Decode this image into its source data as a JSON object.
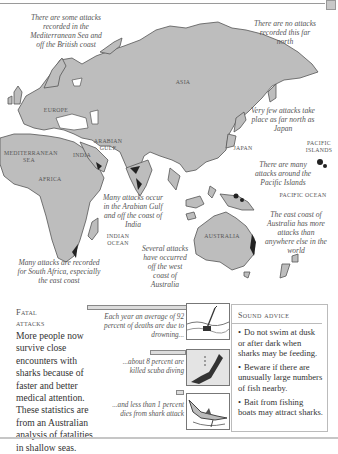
{
  "map": {
    "continents": {
      "europe": "Europe",
      "asia": "Asia",
      "africa": "Africa",
      "india": "India",
      "australia": "Australia",
      "japan": "Japan"
    },
    "seas": {
      "mediterranean": "Mediterranean Sea",
      "arabian_gulf": "Arabian Gulf",
      "indian_ocean": "Indian Ocean",
      "pacific_ocean": "Pacific ocean",
      "pacific_islands": "Pacific Islands"
    },
    "notes": {
      "mediterranean": "There are some attacks recorded in the Mediterranean Sea and off the British coast",
      "far_north": "There are no attacks recorded this far north",
      "japan": "Very few attacks take place as far north as Japan",
      "pacific": "There are many attacks around the Pacific Islands",
      "east_australia": "The east coast of Australia has more attacks than anywhere else in the world",
      "arabian": "Many attacks occur in the Arabian Gulf and off the coast of India",
      "west_australia": "Several attacks have occurred off the west coast of Australia",
      "south_africa": "Many attacks are recorded for South Africa, especially the east coast"
    },
    "colors": {
      "land": "#bdbdbd",
      "land_edge": "#555555",
      "hotspot": "#222222"
    }
  },
  "fatal": {
    "title_line1": "Fatal",
    "title_line2": "attacks",
    "body": "More people now survive close encounters with sharks because of faster and better medical attention. These statistics are from an Australian analysis of fatalities in shallow seas."
  },
  "stats": [
    {
      "label": "Each year an average of 92 percent of deaths are due to drowning...",
      "percent": 92,
      "icon": "drowning-swimmer-icon"
    },
    {
      "label": "...about 8 percent are killed scuba diving",
      "percent": 8,
      "icon": "scuba-diver-icon"
    },
    {
      "label": "...and less than 1 percent dies from shark attack",
      "percent": 1,
      "icon": "shark-attack-icon"
    }
  ],
  "advice": {
    "title": "Sound advice",
    "items": [
      "Do not swim at dusk or after dark when sharks may be feeding.",
      "Beware if there are unusually large numbers of fish nearby.",
      "Bait from fishing boats may attract sharks."
    ],
    "bullet": "•"
  }
}
